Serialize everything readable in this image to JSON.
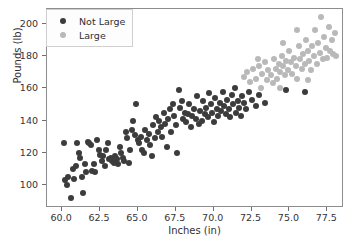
{
  "chart_data": {
    "type": "scatter",
    "title": "",
    "xlabel": "Inches (in)",
    "ylabel": "Pounds (lb)",
    "xlim": [
      59.0,
      78.6
    ],
    "ylim": [
      86,
      209
    ],
    "xticks": [
      "60.0",
      "62.5",
      "65.0",
      "67.5",
      "70.0",
      "72.5",
      "75.0",
      "77.5"
    ],
    "xtick_values": [
      60.0,
      62.5,
      65.0,
      67.5,
      70.0,
      72.5,
      75.0,
      77.5
    ],
    "yticks": [
      "100",
      "120",
      "140",
      "160",
      "180",
      "200"
    ],
    "ytick_values": [
      100,
      120,
      140,
      160,
      180,
      200
    ],
    "grid": false,
    "legend_position": "upper left",
    "colors": {
      "not_large": "#3c3c3c",
      "large": "#b9b9b9",
      "axis": "#8d8d8d",
      "background": "#ffffff"
    },
    "series": [
      {
        "name": "Not Large",
        "color": "#3c3c3c",
        "points": [
          [
            60.1,
            126
          ],
          [
            60.2,
            103
          ],
          [
            60.3,
            100
          ],
          [
            60.4,
            105
          ],
          [
            60.6,
            92
          ],
          [
            60.7,
            110
          ],
          [
            60.8,
            104
          ],
          [
            60.9,
            112
          ],
          [
            61.0,
            126
          ],
          [
            61.1,
            120
          ],
          [
            61.2,
            117
          ],
          [
            61.3,
            105
          ],
          [
            61.4,
            95
          ],
          [
            61.5,
            113
          ],
          [
            61.6,
            108
          ],
          [
            61.7,
            127
          ],
          [
            61.8,
            126
          ],
          [
            61.9,
            125
          ],
          [
            62.0,
            109
          ],
          [
            62.1,
            113
          ],
          [
            62.2,
            108
          ],
          [
            62.3,
            128
          ],
          [
            62.4,
            122
          ],
          [
            62.5,
            119
          ],
          [
            62.6,
            115
          ],
          [
            62.7,
            118
          ],
          [
            62.8,
            112
          ],
          [
            62.9,
            122
          ],
          [
            63.0,
            126
          ],
          [
            63.1,
            116
          ],
          [
            63.2,
            117
          ],
          [
            63.3,
            115
          ],
          [
            63.4,
            114
          ],
          [
            63.5,
            118
          ],
          [
            63.6,
            116
          ],
          [
            63.7,
            113
          ],
          [
            63.8,
            124
          ],
          [
            63.9,
            120
          ],
          [
            64.0,
            117
          ],
          [
            64.1,
            115
          ],
          [
            64.2,
            133
          ],
          [
            64.3,
            129
          ],
          [
            64.4,
            114
          ],
          [
            64.5,
            122
          ],
          [
            64.6,
            134
          ],
          [
            64.7,
            140
          ],
          [
            64.8,
            131
          ],
          [
            64.9,
            150
          ],
          [
            65.0,
            128
          ],
          [
            65.1,
            126
          ],
          [
            65.2,
            130
          ],
          [
            65.3,
            122
          ],
          [
            65.4,
            120
          ],
          [
            65.5,
            134
          ],
          [
            65.6,
            128
          ],
          [
            65.7,
            132
          ],
          [
            65.8,
            125
          ],
          [
            65.9,
            118
          ],
          [
            66.0,
            137
          ],
          [
            66.1,
            129
          ],
          [
            66.2,
            142
          ],
          [
            66.3,
            133
          ],
          [
            66.4,
            140
          ],
          [
            66.5,
            136
          ],
          [
            66.6,
            130
          ],
          [
            66.7,
            145
          ],
          [
            66.8,
            138
          ],
          [
            66.9,
            124
          ],
          [
            67.0,
            141
          ],
          [
            67.1,
            147
          ],
          [
            67.2,
            133
          ],
          [
            67.3,
            150
          ],
          [
            67.4,
            143
          ],
          [
            67.5,
            137
          ],
          [
            67.6,
            120
          ],
          [
            67.7,
            159
          ],
          [
            67.8,
            148
          ],
          [
            67.9,
            152
          ],
          [
            68.0,
            141
          ],
          [
            68.1,
            145
          ],
          [
            68.2,
            139
          ],
          [
            68.3,
            144
          ],
          [
            68.4,
            150
          ],
          [
            68.5,
            136
          ],
          [
            68.6,
            143
          ],
          [
            68.7,
            147
          ],
          [
            68.8,
            141
          ],
          [
            68.9,
            155
          ],
          [
            69.0,
            138
          ],
          [
            69.1,
            146
          ],
          [
            69.2,
            140
          ],
          [
            69.3,
            152
          ],
          [
            69.4,
            144
          ],
          [
            69.5,
            148
          ],
          [
            69.6,
            142
          ],
          [
            69.7,
            157
          ],
          [
            69.8,
            150
          ],
          [
            69.9,
            145
          ],
          [
            70.0,
            139
          ],
          [
            70.1,
            154
          ],
          [
            70.2,
            147
          ],
          [
            70.3,
            143
          ],
          [
            70.4,
            151
          ],
          [
            70.5,
            146
          ],
          [
            70.6,
            158
          ],
          [
            70.7,
            149
          ],
          [
            70.8,
            144
          ],
          [
            70.9,
            153
          ],
          [
            71.0,
            147
          ],
          [
            71.1,
            142
          ],
          [
            71.2,
            156
          ],
          [
            71.3,
            150
          ],
          [
            71.4,
            160
          ],
          [
            71.5,
            145
          ],
          [
            71.6,
            152
          ],
          [
            71.7,
            148
          ],
          [
            71.8,
            143
          ],
          [
            71.9,
            155
          ],
          [
            72.0,
            151
          ],
          [
            72.1,
            147
          ],
          [
            72.3,
            158
          ],
          [
            72.5,
            153
          ],
          [
            72.8,
            149
          ],
          [
            73.0,
            156
          ],
          [
            73.4,
            151
          ],
          [
            74.8,
            159
          ],
          [
            76.0,
            158
          ]
        ]
      },
      {
        "name": "Large",
        "color": "#b9b9b9",
        "points": [
          [
            72.0,
            167
          ],
          [
            72.2,
            170
          ],
          [
            72.4,
            164
          ],
          [
            72.6,
            172
          ],
          [
            72.8,
            166
          ],
          [
            73.0,
            174
          ],
          [
            73.1,
            160
          ],
          [
            73.2,
            169
          ],
          [
            73.4,
            176
          ],
          [
            73.5,
            165
          ],
          [
            73.6,
            171
          ],
          [
            73.8,
            168
          ],
          [
            74.0,
            178
          ],
          [
            74.1,
            172
          ],
          [
            74.2,
            166
          ],
          [
            74.3,
            175
          ],
          [
            74.4,
            170
          ],
          [
            74.5,
            180
          ],
          [
            74.6,
            174
          ],
          [
            74.7,
            168
          ],
          [
            74.8,
            177
          ],
          [
            74.9,
            171
          ],
          [
            75.0,
            183
          ],
          [
            75.1,
            176
          ],
          [
            75.2,
            169
          ],
          [
            75.3,
            179
          ],
          [
            75.4,
            174
          ],
          [
            75.5,
            166
          ],
          [
            75.6,
            186
          ],
          [
            75.7,
            178
          ],
          [
            75.8,
            172
          ],
          [
            75.9,
            181
          ],
          [
            76.0,
            175
          ],
          [
            76.1,
            190
          ],
          [
            76.2,
            183
          ],
          [
            76.3,
            177
          ],
          [
            76.4,
            171
          ],
          [
            76.5,
            186
          ],
          [
            76.6,
            180
          ],
          [
            76.7,
            196
          ],
          [
            76.8,
            175
          ],
          [
            76.9,
            188
          ],
          [
            77.0,
            182
          ],
          [
            77.1,
            204
          ],
          [
            77.2,
            178
          ],
          [
            77.3,
            192
          ],
          [
            77.4,
            185
          ],
          [
            77.5,
            179
          ],
          [
            77.6,
            198
          ],
          [
            77.7,
            183
          ],
          [
            77.8,
            190
          ],
          [
            77.9,
            181
          ],
          [
            78.0,
            194
          ],
          [
            78.1,
            180
          ],
          [
            75.5,
            196
          ],
          [
            74.6,
            188
          ],
          [
            76.2,
            165
          ],
          [
            73.9,
            163
          ],
          [
            72.9,
            178
          ],
          [
            74.4,
            160
          ]
        ]
      }
    ]
  },
  "legend": {
    "entries": [
      {
        "label": "Not Large",
        "color": "#3c3c3c"
      },
      {
        "label": "Large",
        "color": "#b9b9b9"
      }
    ]
  }
}
